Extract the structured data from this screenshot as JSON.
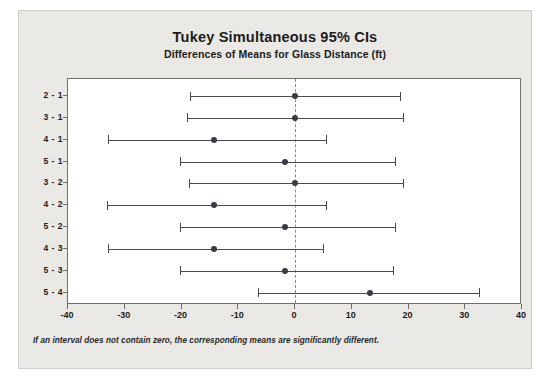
{
  "chart_data": {
    "type": "scatter",
    "title": "Tukey Simultaneous 95% CIs",
    "subtitle": "Differences of Means for Glass Distance (ft)",
    "xlabel": "",
    "ylabel": "",
    "xlim": [
      -40,
      40
    ],
    "xticks": [
      -40,
      -30,
      -20,
      -10,
      0,
      10,
      20,
      30,
      40
    ],
    "xtick_labels": [
      "-40",
      "-30",
      "-20",
      "-10",
      "0",
      "10",
      "20",
      "30",
      "40"
    ],
    "categories": [
      "2 - 1",
      "3 - 1",
      "4 - 1",
      "5 - 1",
      "3 - 2",
      "4 - 2",
      "5 - 2",
      "4 - 3",
      "5 - 3",
      "5 - 4"
    ],
    "reference_line": 0,
    "grid": false,
    "legend": "none",
    "intervals": [
      {
        "label": "2 - 1",
        "lower": -18.5,
        "center": 0.0,
        "upper": 18.5
      },
      {
        "label": "3 - 1",
        "lower": -19.0,
        "center": 0.0,
        "upper": 19.0
      },
      {
        "label": "4 - 1",
        "lower": -33.0,
        "center": -14.2,
        "upper": 5.5
      },
      {
        "label": "5 - 1",
        "lower": -20.3,
        "center": -1.8,
        "upper": 17.7
      },
      {
        "label": "3 - 2",
        "lower": -18.6,
        "center": 0.0,
        "upper": 19.0
      },
      {
        "label": "4 - 2",
        "lower": -33.1,
        "center": -14.2,
        "upper": 5.5
      },
      {
        "label": "5 - 2",
        "lower": -20.2,
        "center": -1.8,
        "upper": 17.7
      },
      {
        "label": "4 - 3",
        "lower": -33.0,
        "center": -14.2,
        "upper": 5.0
      },
      {
        "label": "5 - 3",
        "lower": -20.3,
        "center": -1.8,
        "upper": 17.2
      },
      {
        "label": "5 - 4",
        "lower": -6.5,
        "center": 13.3,
        "upper": 32.4
      }
    ],
    "annotation": "If an interval does not contain zero, the corresponding means are significantly different."
  },
  "colors": {
    "paper": "#eceae6",
    "plot_background": "#ffffff",
    "axis": "#6e6e6e",
    "interval": "#4a4a4a",
    "marker": "#3a3a46",
    "text": "#1b1b1b"
  }
}
